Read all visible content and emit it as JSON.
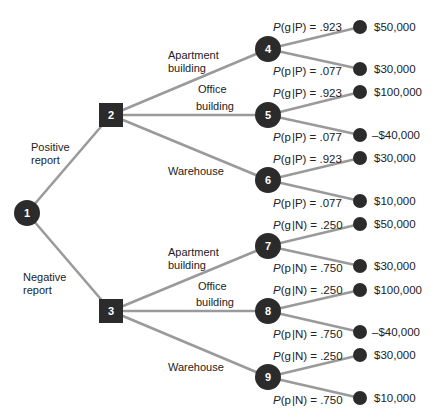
{
  "colors": {
    "branch": "#9a9a9a",
    "node": "#2b2b2b",
    "text": "#222222",
    "background": "#ffffff"
  },
  "root": {
    "id": "1",
    "label": "1",
    "shape": "circle"
  },
  "report_branches": [
    {
      "label_line1": "Positive",
      "label_line2": "report",
      "to": "2"
    },
    {
      "label_line1": "Negative",
      "label_line2": "report",
      "to": "3"
    }
  ],
  "decision_nodes": [
    {
      "id": "2",
      "label": "2",
      "shape": "square"
    },
    {
      "id": "3",
      "label": "3",
      "shape": "square"
    }
  ],
  "alternatives": [
    {
      "from": "2",
      "to": "4",
      "label_line1": "Apartment",
      "label_line2": "building"
    },
    {
      "from": "2",
      "to": "5",
      "label_line1": "Office",
      "label_line2": "building"
    },
    {
      "from": "2",
      "to": "6",
      "label_line1": "Warehouse",
      "label_line2": ""
    },
    {
      "from": "3",
      "to": "7",
      "label_line1": "Apartment",
      "label_line2": "building"
    },
    {
      "from": "3",
      "to": "8",
      "label_line1": "Office",
      "label_line2": "building"
    },
    {
      "from": "3",
      "to": "9",
      "label_line1": "Warehouse",
      "label_line2": ""
    }
  ],
  "chance_nodes": [
    {
      "id": "4",
      "label": "4",
      "good": {
        "state": "g",
        "given": "P",
        "prob": ".923",
        "payoff": "$50,000"
      },
      "poor": {
        "state": "p",
        "given": "P",
        "prob": ".077",
        "payoff": "$30,000"
      }
    },
    {
      "id": "5",
      "label": "5",
      "good": {
        "state": "g",
        "given": "P",
        "prob": ".923",
        "payoff": "$100,000"
      },
      "poor": {
        "state": "p",
        "given": "P",
        "prob": ".077",
        "payoff": "–$40,000"
      }
    },
    {
      "id": "6",
      "label": "6",
      "good": {
        "state": "g",
        "given": "P",
        "prob": ".923",
        "payoff": "$30,000"
      },
      "poor": {
        "state": "p",
        "given": "P",
        "prob": ".077",
        "payoff": "$10,000"
      }
    },
    {
      "id": "7",
      "label": "7",
      "good": {
        "state": "g",
        "given": "N",
        "prob": ".250",
        "payoff": "$50,000"
      },
      "poor": {
        "state": "p",
        "given": "N",
        "prob": ".750",
        "payoff": "$30,000"
      }
    },
    {
      "id": "8",
      "label": "8",
      "good": {
        "state": "g",
        "given": "N",
        "prob": ".250",
        "payoff": "$100,000"
      },
      "poor": {
        "state": "p",
        "given": "N",
        "prob": ".750",
        "payoff": "–$40,000"
      }
    },
    {
      "id": "9",
      "label": "9",
      "good": {
        "state": "g",
        "given": "N",
        "prob": ".250",
        "payoff": "$30,000"
      },
      "poor": {
        "state": "p",
        "given": "N",
        "prob": ".750",
        "payoff": "$10,000"
      }
    }
  ]
}
